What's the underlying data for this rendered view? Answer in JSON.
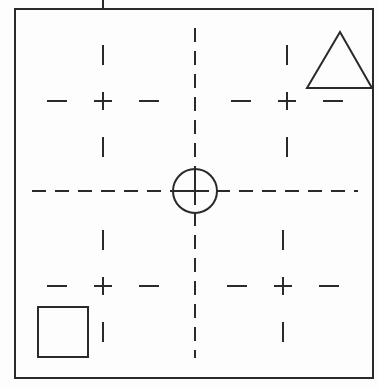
{
  "page": {
    "width": 379,
    "height": 389,
    "background_color": "#fdfdfd",
    "stroke_color": "#2a2a2a"
  },
  "frame": {
    "name": "outer-border",
    "x": 15,
    "y": 9,
    "width": 358,
    "height": 369,
    "stroke_width": 2,
    "fill": "none"
  },
  "top_tick": {
    "name": "top-edge-tick",
    "x": 103,
    "y1": 0,
    "y2": 8,
    "stroke_width": 2
  },
  "center_target": {
    "name": "center-alignment-target",
    "circle": {
      "cx": 195,
      "cy": 191,
      "r": 22,
      "stroke_width": 2,
      "fill": "none"
    },
    "crosshair": {
      "arm_length": 14,
      "stroke_width": 2
    }
  },
  "axes": {
    "horizontal": {
      "name": "horizontal-centerline",
      "y": 191,
      "x1": 32,
      "x2": 358,
      "dash": "14 9",
      "stroke_width": 2
    },
    "vertical": {
      "name": "vertical-centerline",
      "x": 195,
      "y1": 28,
      "y2": 358,
      "dash": "14 9",
      "stroke_width": 2
    }
  },
  "registration_marks": [
    {
      "name": "registration-mark-top-left",
      "cx": 103,
      "cy": 101
    },
    {
      "name": "registration-mark-top-right",
      "cx": 287,
      "cy": 101
    },
    {
      "name": "registration-mark-bottom-left",
      "cx": 103,
      "cy": 286
    },
    {
      "name": "registration-mark-bottom-right",
      "cx": 283,
      "cy": 286
    }
  ],
  "registration_mark_geometry": {
    "cross_arm": 9,
    "tick_gap": 36,
    "tick_length": 20,
    "stroke_width": 2
  },
  "shapes": {
    "triangle": {
      "name": "triangle-marker",
      "apex_x": 340,
      "apex_y": 32,
      "left_x": 307,
      "right_x": 372,
      "base_y": 88,
      "stroke_width": 2,
      "fill": "none"
    },
    "square": {
      "name": "square-marker",
      "x": 38,
      "y": 307,
      "width": 50,
      "height": 50,
      "stroke_width": 2,
      "fill": "none"
    }
  }
}
